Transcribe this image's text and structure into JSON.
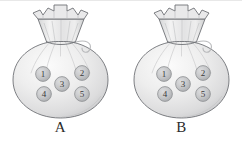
{
  "figure": {
    "background_color": "#ffffff",
    "width": 242,
    "height": 142
  },
  "colors": {
    "bag_outline": "#6f7276",
    "bag_fill_light": "#f4f4f4",
    "bag_fill_mid": "#e2e2e2",
    "bag_fill_dark": "#c9cacb",
    "neck_fill": "#e0e0e0",
    "ball_fill": "#c4c5c7",
    "ball_outline": "#8e9093",
    "ball_number": "#3a3a3a",
    "label_text": "#2b2b2b",
    "top_border": "#e8e8e8"
  },
  "bags": [
    {
      "id": "A",
      "label": "A",
      "balls": [
        {
          "number": "1",
          "position": "upper-left",
          "cx": 43,
          "cy": 73
        },
        {
          "number": "2",
          "position": "upper-right",
          "cx": 82,
          "cy": 72
        },
        {
          "number": "3",
          "position": "center",
          "cx": 62,
          "cy": 83
        },
        {
          "number": "4",
          "position": "lower-left",
          "cx": 44,
          "cy": 93
        },
        {
          "number": "5",
          "position": "lower-right",
          "cx": 82,
          "cy": 93
        }
      ]
    },
    {
      "id": "B",
      "label": "B",
      "balls": [
        {
          "number": "1",
          "position": "upper-left",
          "cx": 43,
          "cy": 73
        },
        {
          "number": "2",
          "position": "upper-right",
          "cx": 82,
          "cy": 72
        },
        {
          "number": "3",
          "position": "center",
          "cx": 62,
          "cy": 83
        },
        {
          "number": "4",
          "position": "lower-left",
          "cx": 44,
          "cy": 93
        },
        {
          "number": "5",
          "position": "lower-right",
          "cx": 82,
          "cy": 93
        }
      ]
    }
  ]
}
